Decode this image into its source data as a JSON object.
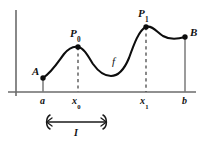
{
  "figure": {
    "axes": {
      "x_axis": {
        "y": 92,
        "x_start": 8,
        "x_end": 196,
        "color": "#6b6b6b"
      },
      "y_axis": {
        "x": 16,
        "y_start": 10,
        "y_end": 96,
        "color": "#6b6b6b"
      }
    },
    "curve": {
      "label": "f",
      "color": "#0d0d0d",
      "stroke_width": 2.1,
      "path": "M 43,78 C 52,72 58,62 64,54 C 69,48 74,46 78,47 C 84,48 88,56 93,64 C 98,71 104,76 111,76 C 118,76 124,70 129,58 C 134,44 139,30 146,27 C 152,25 157,32 163,36 C 170,40 178,39 185,37"
    },
    "points": [
      {
        "id": "A",
        "label": "A",
        "sub": "",
        "x": 43,
        "y": 78
      },
      {
        "id": "P0",
        "label": "P",
        "sub": "0",
        "x": 78,
        "y": 47
      },
      {
        "id": "P1",
        "label": "P",
        "sub": "1",
        "x": 146,
        "y": 27
      },
      {
        "id": "B",
        "label": "B",
        "sub": "",
        "x": 185,
        "y": 37
      }
    ],
    "point_labels": [
      {
        "id": "A",
        "text": "A",
        "sub": "",
        "left": 32,
        "top": 66
      },
      {
        "id": "P0",
        "text": "P",
        "sub": "0",
        "left": 70,
        "top": 28
      },
      {
        "id": "P1",
        "text": "P",
        "sub": "1",
        "left": 138,
        "top": 8
      },
      {
        "id": "B",
        "text": "B",
        "sub": "",
        "left": 190,
        "top": 27
      }
    ],
    "function_label": {
      "text": "f",
      "left": 112,
      "top": 56
    },
    "solid_drop_lines": [
      {
        "id": "a",
        "x": 43,
        "y_top": 78,
        "y_bottom": 92,
        "color": "#7a7a7a"
      },
      {
        "id": "b",
        "x": 185,
        "y_top": 37,
        "y_bottom": 92,
        "color": "#7a7a7a"
      }
    ],
    "dashed_drop_lines": [
      {
        "id": "x0",
        "x": 78,
        "y_top": 47,
        "y_bottom": 92,
        "color": "#4a4a4a"
      },
      {
        "id": "x1",
        "x": 146,
        "y_top": 27,
        "y_bottom": 92,
        "color": "#4a4a4a"
      }
    ],
    "x_ticks": [
      {
        "id": "a",
        "text": "a",
        "sub": "",
        "x": 43,
        "top": 96
      },
      {
        "id": "x0",
        "text": "x",
        "sub": "0",
        "x": 78,
        "top": 96
      },
      {
        "id": "x1",
        "text": "x",
        "sub": "1",
        "x": 146,
        "top": 96
      },
      {
        "id": "b",
        "text": "b",
        "sub": "",
        "x": 185,
        "top": 96
      }
    ],
    "interval_bracket": {
      "label": "I",
      "x_start": 45,
      "x_end": 108,
      "y": 122,
      "label_left": 74,
      "label_top": 128,
      "color": "#1a1a1a"
    }
  },
  "chart_data": {
    "type": "line",
    "xlabel": "",
    "ylabel": "",
    "grid": false,
    "legend": "none",
    "axis_style": "bare-axes-no-ticks-no-numbers",
    "series": [
      {
        "name": "f",
        "annotation": "f",
        "description": "Smooth continuous curve from A rising to local maximum P0, falling to an interior local minimum, rising to the global maximum P1, dipping to a local minimum, then rising to the right endpoint B",
        "x": [
          43,
          64,
          78,
          93,
          111,
          129,
          146,
          163,
          185
        ],
        "y_pixel": [
          78,
          54,
          47,
          64,
          76,
          58,
          27,
          36,
          37
        ],
        "feature_labels": [
          "A",
          "",
          "P0",
          "",
          "local min",
          "",
          "P1",
          "local min",
          "B"
        ]
      }
    ],
    "marked_points": [
      {
        "name": "A",
        "x_label": "a",
        "role": "left endpoint"
      },
      {
        "name": "P0",
        "x_label": "x0",
        "role": "local maximum"
      },
      {
        "name": "P1",
        "x_label": "x1",
        "role": "global maximum"
      },
      {
        "name": "B",
        "x_label": "b",
        "role": "right endpoint"
      }
    ],
    "x_tick_labels": [
      "a",
      "x0",
      "x1",
      "b"
    ],
    "annotations": [
      {
        "text": "f",
        "meaning": "curve name"
      },
      {
        "text": "I",
        "meaning": "interval bracket beneath the x-axis spanning from near a to past x0"
      }
    ]
  }
}
